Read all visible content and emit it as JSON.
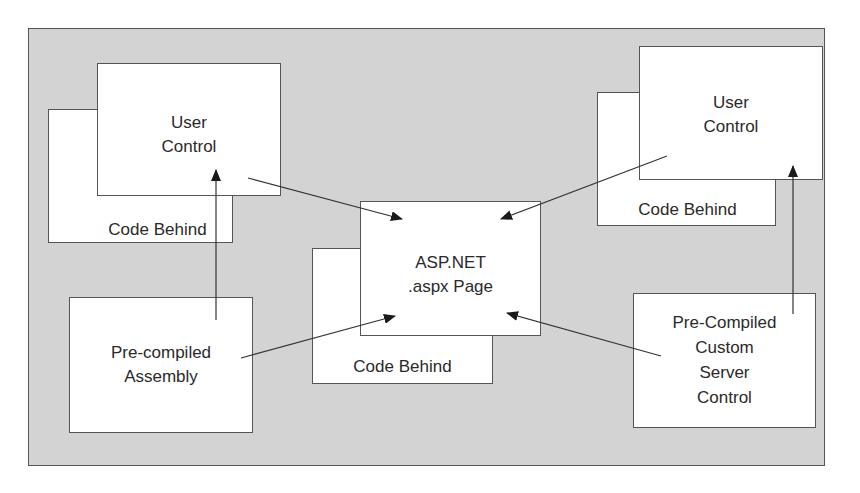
{
  "diagram": {
    "nodes": {
      "left_code_behind": {
        "label": "Code Behind"
      },
      "left_user_control": {
        "line1": "User",
        "line2": "Control"
      },
      "center_code_behind": {
        "label": "Code Behind"
      },
      "center_page": {
        "line1": "ASP.NET",
        "line2": ".aspx Page"
      },
      "right_code_behind": {
        "label": "Code Behind"
      },
      "right_user_control": {
        "line1": "User",
        "line2": "Control"
      },
      "precompiled_assembly": {
        "line1": "Pre-compiled",
        "line2": "Assembly"
      },
      "custom_server_control": {
        "line1": "Pre-Compiled",
        "line2": "Custom",
        "line3": "Server",
        "line4": "Control"
      }
    },
    "edges": [
      {
        "from": "left_user_control",
        "to": "center_page"
      },
      {
        "from": "right_user_control",
        "to": "center_page"
      },
      {
        "from": "precompiled_assembly",
        "to": "center_page"
      },
      {
        "from": "custom_server_control",
        "to": "center_page"
      },
      {
        "from": "precompiled_assembly",
        "to": "left_user_control"
      },
      {
        "from": "custom_server_control",
        "to": "right_user_control"
      }
    ],
    "colors": {
      "background": "#d3d3d3",
      "box": "#ffffff",
      "stroke": "#555555",
      "arrow": "#1a1a1a"
    }
  }
}
